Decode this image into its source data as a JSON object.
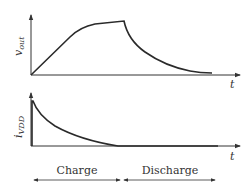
{
  "diagram": {
    "top_plot": {
      "y_label_main": "v",
      "y_label_sub": "out",
      "x_label": "t",
      "curve_name": "output-voltage"
    },
    "bottom_plot": {
      "y_label_main": "i",
      "y_label_sub": "VDD",
      "x_label": "t",
      "curve_name": "supply-current"
    },
    "phases": [
      {
        "label": "Charge"
      },
      {
        "label": "Discharge"
      }
    ],
    "colors": {
      "line": "#2a2a2a",
      "text": "#333333",
      "background": "#ffffff"
    }
  }
}
